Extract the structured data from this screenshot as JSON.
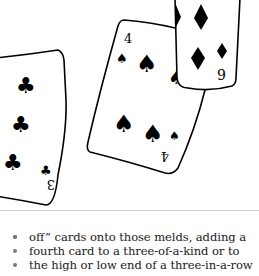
{
  "illustration": {
    "description": "hand-drawn playing cards",
    "cards": [
      {
        "rank": "3",
        "suit": "clubs",
        "suit_glyph": "♣"
      },
      {
        "rank": "4",
        "suit": "spades",
        "suit_glyph": "♠"
      },
      {
        "rank": "9",
        "suit": "diamonds",
        "suit_glyph": "♦"
      }
    ]
  },
  "body": {
    "lines": [
      "off” cards onto those melds, adding a",
      "fourth card to a three-of-a-kind or to",
      "the high or low end of a three-in-a-row"
    ]
  }
}
